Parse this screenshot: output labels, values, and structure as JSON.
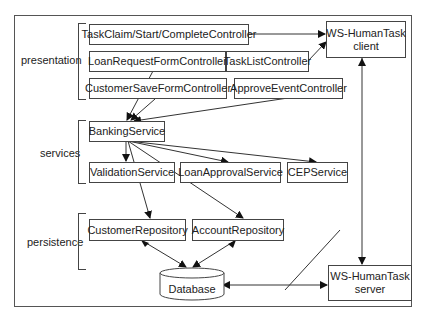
{
  "layers": {
    "presentation": "presentation",
    "services": "services",
    "persistence": "persistence"
  },
  "presentation": {
    "task_claim": "TaskClaim/Start/CompleteController",
    "loan_request_form": "LoanRequestFormController",
    "customer_save_form": "CustomerSaveFormController",
    "task_list": "TaskListController",
    "approve_event": "ApproveEventController"
  },
  "services": {
    "banking": "BankingService",
    "validation": "ValidationService",
    "loan_approval": "LoanApprovalService",
    "cep": "CEPService"
  },
  "persistence": {
    "customer_repo": "CustomerRepository",
    "account_repo": "AccountRepository",
    "database": "Database"
  },
  "external": {
    "client_line1": "WS-HumanTask",
    "client_line2": "client",
    "server_line1": "WS-HumanTask",
    "server_line2": "server"
  },
  "colors": {
    "line": "#333333",
    "background": "#ffffff"
  }
}
